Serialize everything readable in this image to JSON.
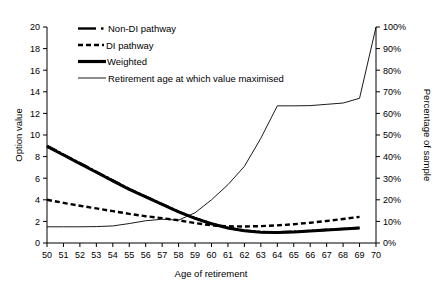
{
  "chart_data": {
    "type": "line",
    "title": "",
    "xlabel": "Age of retirement",
    "ylabel": "Option value",
    "y2label": "Percentage of sample",
    "xlim": [
      50,
      70
    ],
    "ylim": [
      0,
      20
    ],
    "y2lim": [
      0,
      100
    ],
    "grid": false,
    "legend_position": "top-left",
    "xticks": [
      "50",
      "51",
      "52",
      "53",
      "54",
      "55",
      "56",
      "57",
      "58",
      "59",
      "60",
      "61",
      "62",
      "63",
      "64",
      "65",
      "66",
      "67",
      "68",
      "69",
      "70"
    ],
    "yticks": [
      "0",
      "2",
      "4",
      "6",
      "8",
      "10",
      "12",
      "14",
      "16",
      "18",
      "20"
    ],
    "y2ticks": [
      "0%",
      "10%",
      "20%",
      "30%",
      "40%",
      "50%",
      "60%",
      "70%",
      "80%",
      "90%",
      "100%"
    ],
    "x": [
      50,
      51,
      52,
      53,
      54,
      55,
      56,
      57,
      58,
      59,
      60,
      61,
      62,
      63,
      64,
      65,
      66,
      67,
      68,
      69
    ],
    "series": [
      {
        "name": "Non-DI pathway",
        "axis": "left",
        "style": "dash-dot",
        "values": [
          9.0,
          8.2,
          7.4,
          6.6,
          5.8,
          5.0,
          4.3,
          3.6,
          2.9,
          2.3,
          1.8,
          1.4,
          1.15,
          1.02,
          1.0,
          1.05,
          1.13,
          1.22,
          1.31,
          1.4
        ]
      },
      {
        "name": "DI pathway",
        "axis": "left",
        "style": "dashed",
        "values": [
          4.0,
          3.72,
          3.45,
          3.2,
          2.95,
          2.7,
          2.48,
          2.3,
          2.1,
          1.85,
          1.63,
          1.55,
          1.53,
          1.56,
          1.63,
          1.74,
          1.88,
          2.04,
          2.22,
          2.42
        ]
      },
      {
        "name": "Weighted",
        "axis": "left",
        "style": "thick-solid",
        "values": [
          8.95,
          8.15,
          7.35,
          6.55,
          5.75,
          4.97,
          4.27,
          3.57,
          2.88,
          2.28,
          1.78,
          1.39,
          1.13,
          1.0,
          0.98,
          1.03,
          1.11,
          1.2,
          1.29,
          1.38
        ]
      },
      {
        "name": "Retirement age at which value maximised",
        "axis": "right",
        "style": "thin-solid",
        "values": [
          7.5,
          7.5,
          7.5,
          7.6,
          7.9,
          9.0,
          10.3,
          11.0,
          10.6,
          14.0,
          20.0,
          27.0,
          35.5,
          48.5,
          63.5,
          63.5,
          63.6,
          64.2,
          64.8,
          67.0
        ],
        "extra_point": {
          "x": 70,
          "value": 100.0
        }
      }
    ]
  },
  "legend": {
    "items": [
      {
        "label": "Non-DI pathway"
      },
      {
        "label": "DI pathway"
      },
      {
        "label": "Weighted"
      },
      {
        "label": "Retirement age at which value maximised"
      }
    ]
  },
  "axes": {
    "left_title": "Option value",
    "right_title": "Percentage of sample",
    "bottom_title": "Age of retirement"
  },
  "colors": {
    "line": "#000000",
    "axis": "#000000",
    "background": "#ffffff"
  }
}
